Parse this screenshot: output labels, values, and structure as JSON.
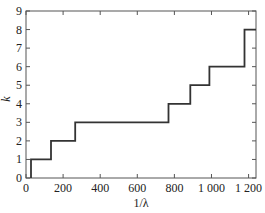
{
  "chart_data": {
    "type": "line",
    "subtype": "step",
    "title": "",
    "xlabel": "1/λ",
    "ylabel": "k",
    "xlim": [
      0,
      1240
    ],
    "ylim": [
      0,
      9
    ],
    "x_ticks": [
      0,
      200,
      400,
      600,
      800,
      1000,
      1200
    ],
    "x_tick_labels": [
      "0",
      "200",
      "400",
      "600",
      "800",
      "1 000",
      "1 200"
    ],
    "y_ticks": [
      0,
      1,
      2,
      3,
      4,
      5,
      6,
      7,
      8,
      9
    ],
    "y_tick_labels": [
      "0",
      "1",
      "2",
      "3",
      "4",
      "5",
      "6",
      "7",
      "8",
      "9"
    ],
    "grid": false,
    "legend": null,
    "series": [
      {
        "name": "k",
        "color": "#333333",
        "x": [
          27,
          27,
          135,
          135,
          265,
          265,
          768,
          768,
          886,
          886,
          989,
          989,
          1178,
          1178,
          1240
        ],
        "y": [
          0,
          1,
          1,
          2,
          2,
          3,
          3,
          4,
          4,
          5,
          5,
          6,
          6,
          8,
          8
        ]
      }
    ]
  }
}
